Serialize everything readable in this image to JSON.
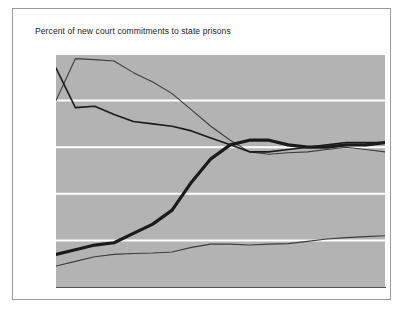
{
  "card": {
    "title": "Percent of new court commitments to state prisons",
    "background": "#ffffff",
    "border_color": "#9a9a9a"
  },
  "axis": {
    "y_ticks": [
      "0",
      "10",
      "20",
      "30",
      "40",
      "50"
    ],
    "x_ticks": [
      "1980",
      "1982",
      "1984",
      "1986",
      "1988",
      "1990",
      "1992",
      "1994",
      "1996",
      "1997"
    ]
  },
  "series_labels": {
    "property": "Property",
    "violent": "Violent",
    "drug": "Drug",
    "public_order": "Public-order"
  },
  "colors": {
    "plot_background": "#b3b3b3",
    "gridline": "#ffffff",
    "line_dark": "#1a1a1a",
    "line_thin": "#3c3c3c"
  },
  "chart_data": {
    "type": "line",
    "title": "Percent of new court commitments to state prisons",
    "xlabel": "",
    "ylabel": "",
    "xlim": [
      1980,
      1997
    ],
    "ylim": [
      0,
      50
    ],
    "grid": true,
    "legend": "inline-annotations",
    "x": [
      1980,
      1981,
      1982,
      1983,
      1984,
      1985,
      1986,
      1987,
      1988,
      1989,
      1990,
      1991,
      1992,
      1993,
      1994,
      1995,
      1996,
      1997
    ],
    "series": [
      {
        "name": "Property",
        "style": "thin",
        "values": [
          40.0,
          49.0,
          48.8,
          48.5,
          46.0,
          44.0,
          41.5,
          38.0,
          34.5,
          31.5,
          29.0,
          28.5,
          28.8,
          29.0,
          29.5,
          30.0,
          29.5,
          29.0
        ]
      },
      {
        "name": "Violent",
        "style": "medium",
        "values": [
          47.0,
          38.5,
          38.8,
          37.0,
          35.5,
          35.0,
          34.5,
          33.5,
          32.0,
          30.5,
          29.0,
          29.0,
          29.5,
          30.0,
          30.5,
          31.0,
          31.0,
          31.0
        ]
      },
      {
        "name": "Drug",
        "style": "thick",
        "values": [
          7.0,
          8.0,
          9.0,
          9.5,
          11.5,
          13.5,
          16.5,
          22.5,
          27.5,
          30.5,
          31.5,
          31.5,
          30.5,
          30.0,
          30.0,
          30.5,
          30.5,
          31.0
        ]
      },
      {
        "name": "Public-order",
        "style": "thin",
        "values": [
          4.5,
          5.5,
          6.5,
          7.0,
          7.2,
          7.3,
          7.5,
          8.5,
          9.2,
          9.2,
          9.0,
          9.2,
          9.3,
          9.8,
          10.3,
          10.6,
          10.8,
          11.0
        ]
      }
    ]
  }
}
